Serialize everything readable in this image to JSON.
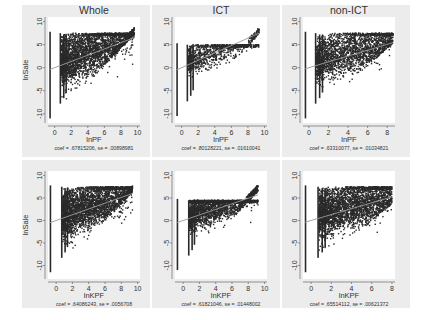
{
  "chart_data": [
    {
      "type": "scatter",
      "panel": "top-left",
      "title": "Whole",
      "xlabel": "lnPF",
      "ylabel": "lnSale",
      "xlim": [
        -0.8,
        10.3
      ],
      "ylim": [
        -12,
        11
      ],
      "xticks": [
        0,
        2,
        4,
        6,
        8,
        10
      ],
      "yticks": [
        10,
        5,
        0,
        -5,
        -10
      ],
      "fit": {
        "intercept": 0.0,
        "slope": 0.67815206
      },
      "note": "coef = .67815206, se = .00898981",
      "cloud": {
        "xmax": 9.6,
        "ytop": 7.5,
        "ylow_at0": -11,
        "density": "very high",
        "spread": 1.0
      }
    },
    {
      "type": "scatter",
      "panel": "top-middle",
      "title": "ICT",
      "xlabel": "lnPF",
      "ylabel": "",
      "xlim": [
        -0.8,
        10.3
      ],
      "ylim": [
        -12,
        11
      ],
      "xticks": [
        0,
        2,
        4,
        6,
        8,
        10
      ],
      "yticks": [
        10,
        5,
        0,
        -5,
        -10
      ],
      "fit": {
        "intercept": 0.0,
        "slope": 0.80128221
      },
      "note": "coef = .80128221, se = .01610041",
      "cloud": {
        "xmax": 9.4,
        "ytop": 5.0,
        "ylow_at0": -10.5,
        "density": "medium",
        "spread": 0.6
      }
    },
    {
      "type": "scatter",
      "panel": "top-right",
      "title": "non-ICT",
      "xlabel": "lnPF",
      "ylabel": "",
      "xlim": [
        -0.6,
        8.8
      ],
      "ylim": [
        -12,
        11
      ],
      "xticks": [
        0,
        2,
        4,
        6,
        8
      ],
      "yticks": [
        10,
        5,
        0,
        -5,
        -10
      ],
      "fit": {
        "intercept": 0.0,
        "slope": 0.63310077
      },
      "note": "coef = .63310077, se = .01034821",
      "cloud": {
        "xmax": 8.6,
        "ytop": 7.5,
        "ylow_at0": -11,
        "density": "high",
        "spread": 0.9
      }
    },
    {
      "type": "scatter",
      "panel": "bottom-left",
      "title": "",
      "xlabel": "lnKPF",
      "ylabel": "lnSale",
      "xlim": [
        -1.0,
        10.3
      ],
      "ylim": [
        -13,
        11
      ],
      "xticks": [
        0,
        2,
        4,
        6,
        8,
        10
      ],
      "yticks": [
        10,
        5,
        0,
        -5,
        -10
      ],
      "fit": {
        "intercept": 0.0,
        "slope": 0.64086243
      },
      "note": "coef = .64086243, se = .0056708",
      "cloud": {
        "xmax": 9.4,
        "ytop": 7.5,
        "ylow_at0": -11.5,
        "density": "very high",
        "spread": 1.0
      }
    },
    {
      "type": "scatter",
      "panel": "bottom-middle",
      "title": "",
      "xlabel": "lnKPF",
      "ylabel": "",
      "xlim": [
        -1.0,
        10.3
      ],
      "ylim": [
        -13,
        11
      ],
      "xticks": [
        0,
        2,
        4,
        6,
        8,
        10
      ],
      "yticks": [
        10,
        5,
        0,
        -5,
        -10
      ],
      "fit": {
        "intercept": 0.0,
        "slope": 0.61821046
      },
      "note": "coef = .61821046, se = .01448002",
      "cloud": {
        "xmax": 9.2,
        "ytop": 4.5,
        "ylow_at0": -11,
        "density": "high",
        "spread": 0.7
      }
    },
    {
      "type": "scatter",
      "panel": "bottom-right",
      "title": "",
      "xlabel": "lnKPF",
      "ylabel": "",
      "xlim": [
        -0.8,
        8.3
      ],
      "ylim": [
        -13,
        11
      ],
      "xticks": [
        0,
        2,
        4,
        6,
        8
      ],
      "yticks": [
        10,
        5,
        0,
        -5,
        -10
      ],
      "fit": {
        "intercept": 0.0,
        "slope": 0.65514112
      },
      "note": "coef = .65514112, se = .00621372",
      "cloud": {
        "xmax": 8.0,
        "ytop": 7.5,
        "ylow_at0": -11.5,
        "density": "very high",
        "spread": 1.0
      }
    }
  ],
  "colors": {
    "background": "#ffffff",
    "panel": "#ececec",
    "plot": "#ffffff",
    "marker": "#2a2a2a",
    "fitline": "#9a9a9a",
    "text": "#333333"
  }
}
